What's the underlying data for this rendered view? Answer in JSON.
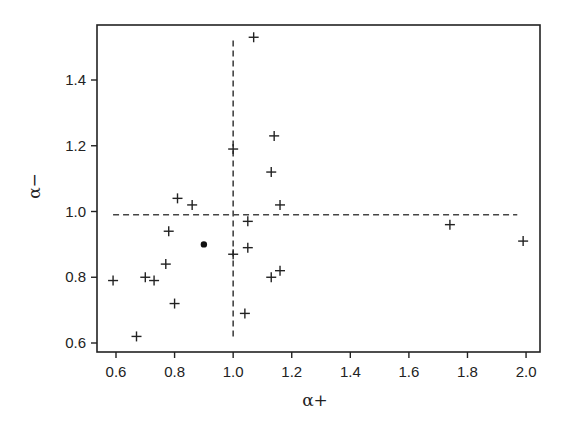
{
  "chart_data": {
    "type": "scatter",
    "title": "",
    "xlabel": "α+",
    "ylabel": "α−",
    "xlim": [
      0.55,
      2.05
    ],
    "ylim": [
      0.58,
      1.58
    ],
    "xticks": [
      0.6,
      0.8,
      1.0,
      1.2,
      1.4,
      1.6,
      1.8,
      2.0
    ],
    "xtick_labels": [
      "0.6",
      "0.8",
      "1.0",
      "1.2",
      "1.4",
      "1.6",
      "1.8",
      "2.0"
    ],
    "yticks": [
      0.6,
      0.8,
      1.0,
      1.2,
      1.4
    ],
    "ytick_labels": [
      "0.6",
      "0.8",
      "1.0",
      "1.2",
      "1.4"
    ],
    "grid": false,
    "legend": null,
    "series": [
      {
        "name": "plus-markers",
        "marker": "+",
        "points": [
          {
            "x": 1.07,
            "y": 1.53
          },
          {
            "x": 1.0,
            "y": 1.19
          },
          {
            "x": 1.14,
            "y": 1.23
          },
          {
            "x": 1.13,
            "y": 1.12
          },
          {
            "x": 1.16,
            "y": 1.02
          },
          {
            "x": 1.05,
            "y": 0.97
          },
          {
            "x": 1.05,
            "y": 0.89
          },
          {
            "x": 1.0,
            "y": 0.87
          },
          {
            "x": 1.13,
            "y": 0.8
          },
          {
            "x": 1.16,
            "y": 0.82
          },
          {
            "x": 1.04,
            "y": 0.69
          },
          {
            "x": 0.81,
            "y": 1.04
          },
          {
            "x": 0.86,
            "y": 1.02
          },
          {
            "x": 0.78,
            "y": 0.94
          },
          {
            "x": 0.77,
            "y": 0.84
          },
          {
            "x": 0.59,
            "y": 0.79
          },
          {
            "x": 0.7,
            "y": 0.8
          },
          {
            "x": 0.73,
            "y": 0.79
          },
          {
            "x": 0.8,
            "y": 0.72
          },
          {
            "x": 0.67,
            "y": 0.62
          },
          {
            "x": 1.74,
            "y": 0.96
          },
          {
            "x": 1.99,
            "y": 0.91
          }
        ]
      },
      {
        "name": "filled-dot",
        "marker": "•",
        "points": [
          {
            "x": 0.9,
            "y": 0.9
          }
        ]
      }
    ],
    "reference_lines": [
      {
        "orientation": "vertical",
        "style": "dashed",
        "x": 1.0,
        "y_from": 0.62,
        "y_to": 1.52
      },
      {
        "orientation": "horizontal",
        "style": "dashed",
        "y": 0.99,
        "x_from": 0.59,
        "x_to": 1.97
      }
    ]
  },
  "colors": {
    "ink": "#222222",
    "dashed": "#444444",
    "background": "#ffffff"
  }
}
